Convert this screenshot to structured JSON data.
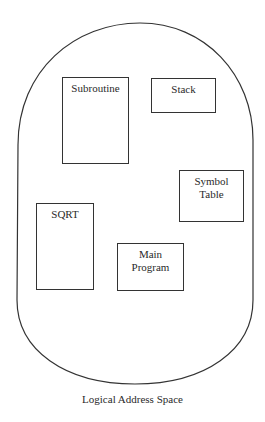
{
  "diagram": {
    "title": "Logical Address Space",
    "container_shape": "stadium",
    "segments": [
      {
        "id": "subroutine",
        "label": "Subroutine",
        "x": 62,
        "y": 77,
        "w": 67,
        "h": 87
      },
      {
        "id": "stack",
        "label": "Stack",
        "x": 151,
        "y": 78,
        "w": 65,
        "h": 35
      },
      {
        "id": "symbol-table",
        "label": "Symbol\nTable",
        "x": 179,
        "y": 170,
        "w": 65,
        "h": 52
      },
      {
        "id": "sqrt",
        "label": "SQRT",
        "x": 36,
        "y": 203,
        "w": 58,
        "h": 87
      },
      {
        "id": "main-program",
        "label": "Main\nProgram",
        "x": 117,
        "y": 243,
        "w": 67,
        "h": 48
      }
    ]
  }
}
